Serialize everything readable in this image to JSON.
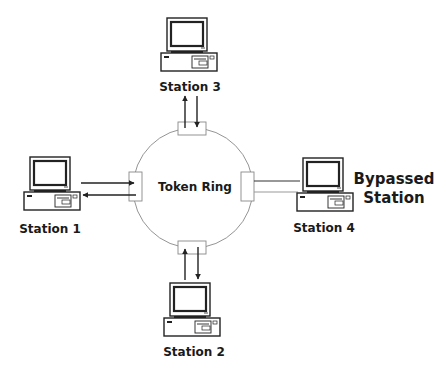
{
  "diagram": {
    "ring": {
      "label": "Token Ring",
      "color": "#888888"
    },
    "stations": [
      {
        "id": "station-1",
        "label": "Station 1",
        "position": "left",
        "connected": true
      },
      {
        "id": "station-2",
        "label": "Station 2",
        "position": "bottom",
        "connected": true
      },
      {
        "id": "station-3",
        "label": "Station 3",
        "position": "top",
        "connected": true
      },
      {
        "id": "station-4",
        "label": "Station 4",
        "position": "right",
        "connected": false
      }
    ],
    "annotation": {
      "line1": "Bypassed",
      "line2": "Station"
    },
    "colors": {
      "line": "#222222",
      "ring": "#888888",
      "text": "#1a1a1a"
    }
  }
}
